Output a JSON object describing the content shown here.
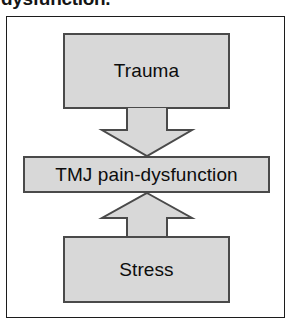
{
  "figure": {
    "caption_partial": "dysfunction.",
    "type": "flow-diagram",
    "background_color": "#ffffff",
    "frame": {
      "name": "outer-frame",
      "border_color": "#1c1c1c"
    },
    "node_fill_color": "#d8d8d8",
    "node_border_color": "#4a4a4a",
    "text_color": "#0d0d0d",
    "nodes": [
      {
        "id": "trauma",
        "label": "Trauma"
      },
      {
        "id": "tmj",
        "label": "TMJ pain-dysfunction"
      },
      {
        "id": "stress",
        "label": "Stress"
      }
    ],
    "arrows": [
      {
        "id": "trauma-to-tmj",
        "icon": "block-arrow-down-icon",
        "direction": "down",
        "from": "Trauma",
        "to": "TMJ pain-dysfunction"
      },
      {
        "id": "stress-to-tmj",
        "icon": "block-arrow-up-icon",
        "direction": "up",
        "from": "Stress",
        "to": "TMJ pain-dysfunction"
      }
    ]
  }
}
